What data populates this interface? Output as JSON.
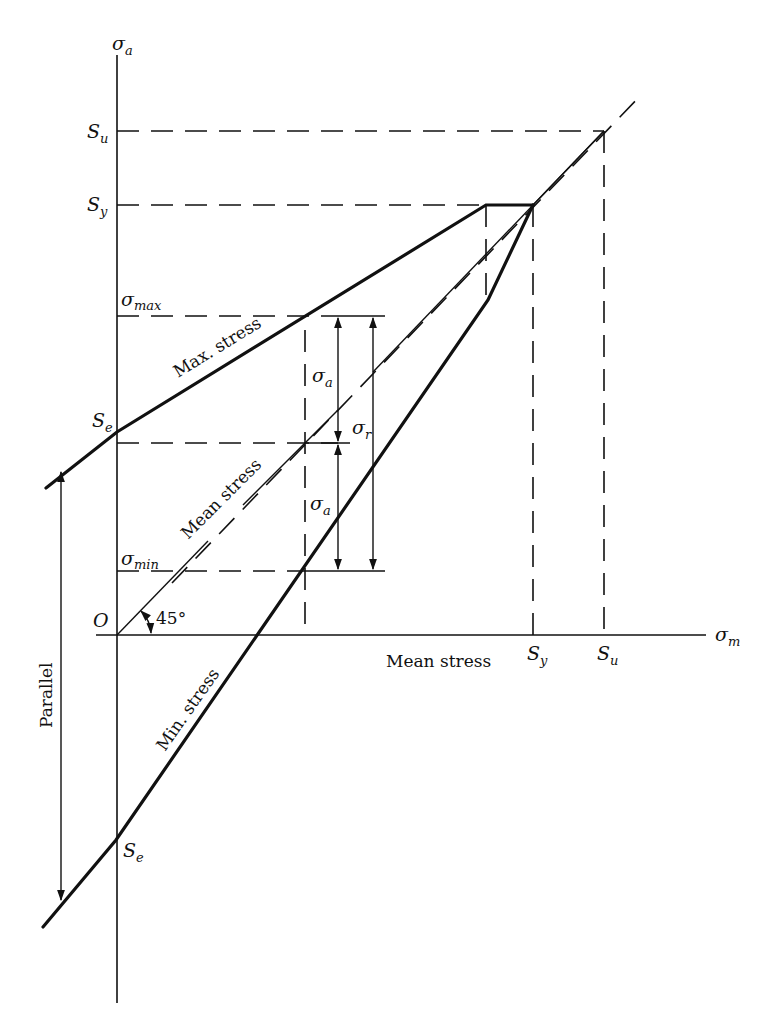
{
  "diagram": {
    "axes": {
      "y_symbol": "σ",
      "y_sub": "a",
      "x_symbol": "σ",
      "x_sub": "m",
      "origin": "O",
      "x_caption": "Mean stress"
    },
    "ticks": {
      "y_su": {
        "main": "S",
        "sub": "u"
      },
      "y_sy": {
        "main": "S",
        "sub": "y"
      },
      "y_smax": {
        "main": "σ",
        "sub": "max"
      },
      "y_se": {
        "main": "S",
        "sub": "e"
      },
      "y_smin": {
        "main": "σ",
        "sub": "min"
      },
      "y_se_neg": {
        "main": "S",
        "sub": "e"
      },
      "x_sy": {
        "main": "S",
        "sub": "y"
      },
      "x_su": {
        "main": "S",
        "sub": "u"
      }
    },
    "labels": {
      "max_stress": "Max. stress",
      "mean_stress": "Mean stress",
      "min_stress": "Min. stress",
      "parallel": "Parallel",
      "angle": "45°",
      "sigma_a_top": {
        "main": "σ",
        "sub": "a"
      },
      "sigma_a_bottom": {
        "main": "σ",
        "sub": "a"
      },
      "sigma_r": {
        "main": "σ",
        "sub": "r"
      }
    }
  }
}
